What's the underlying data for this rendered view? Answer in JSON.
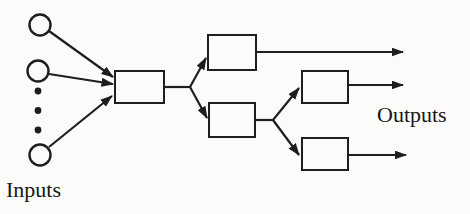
{
  "figure": {
    "labels": {
      "inputs": "Inputs",
      "outputs": "Outputs"
    },
    "colors": {
      "ink": "#1e1e1e",
      "paper": "#fbfbf9"
    },
    "structure": {
      "type": "node-link-diagram",
      "input_circle_count": 3,
      "ellipsis_dot_count": 3,
      "box_count": 5,
      "output_arrow_count": 3
    }
  }
}
